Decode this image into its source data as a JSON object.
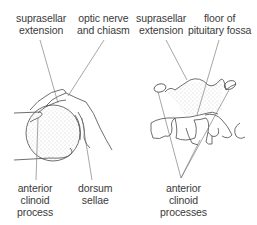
{
  "diagram": {
    "colors": {
      "line": "#4a4a4a",
      "stipple": "#9a9a9a",
      "text": "#3a3a3a",
      "background": "#ffffff"
    },
    "left_panel": {
      "labels": {
        "suprasellar_extension": [
          "suprasellar",
          "extension"
        ],
        "optic_nerve_and_chiasm": [
          "optic nerve",
          "and chiasm"
        ],
        "anterior_clinoid_process": [
          "anterior",
          "clinoid",
          "process"
        ],
        "dorsum_sellae": [
          "dorsum",
          "sellae"
        ]
      }
    },
    "right_panel": {
      "labels": {
        "suprasellar_extension": [
          "suprasellar",
          "extension"
        ],
        "floor_of_pituitary_fossa": [
          "floor of",
          "pituitary fossa"
        ],
        "anterior_clinoid_processes": [
          "anterior",
          "clinoid",
          "processes"
        ]
      }
    }
  }
}
